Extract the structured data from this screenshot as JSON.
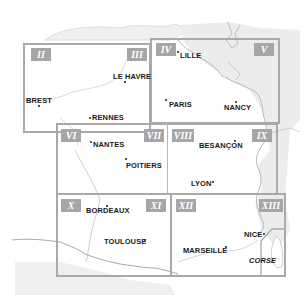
{
  "map": {
    "colors": {
      "border": "#a9a9a9",
      "tag_bg": "#a6a6a6",
      "tag_text": "#ffffff",
      "land_outside": "#eeeeee",
      "coast": "#bdbdbd",
      "city_text": "#1a1a1a"
    },
    "zones": [
      {
        "id": "II",
        "label": "II"
      },
      {
        "id": "III",
        "label": "III"
      },
      {
        "id": "IV",
        "label": "IV"
      },
      {
        "id": "V",
        "label": "V"
      },
      {
        "id": "VI",
        "label": "VI"
      },
      {
        "id": "VII",
        "label": "VII"
      },
      {
        "id": "VIII",
        "label": "VIII"
      },
      {
        "id": "IX",
        "label": "IX"
      },
      {
        "id": "X",
        "label": "X"
      },
      {
        "id": "XI",
        "label": "XI"
      },
      {
        "id": "XII",
        "label": "XII"
      },
      {
        "id": "XIII",
        "label": "XIII"
      }
    ],
    "cities": [
      {
        "name": "LILLE"
      },
      {
        "name": "LE HAVRE"
      },
      {
        "name": "PARIS"
      },
      {
        "name": "NANCY"
      },
      {
        "name": "BREST"
      },
      {
        "name": "RENNES"
      },
      {
        "name": "NANTES"
      },
      {
        "name": "POITIERS"
      },
      {
        "name": "BESANÇON"
      },
      {
        "name": "LYON"
      },
      {
        "name": "BORDEAUX"
      },
      {
        "name": "TOULOUSE"
      },
      {
        "name": "NICE"
      },
      {
        "name": "MARSEILLE"
      }
    ],
    "inset_label": "CORSE"
  }
}
